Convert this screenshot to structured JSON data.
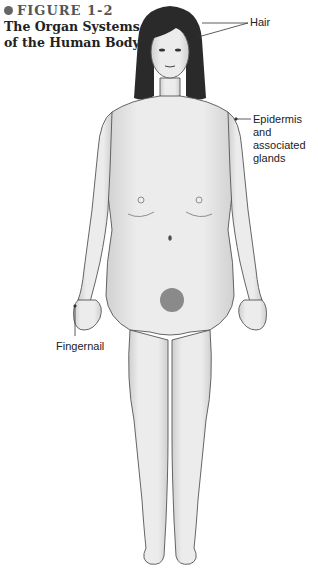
{
  "figure": {
    "number": "FIGURE 1-2",
    "caption_line1": "The Organ Systems",
    "caption_line2": "of the Human Body."
  },
  "labels": {
    "hair": "Hair",
    "epidermis_line1": "Epidermis and",
    "epidermis_line2": "associated",
    "epidermis_line3": "glands",
    "fingernail": "Fingernail"
  },
  "colors": {
    "skin": "#e6e6e6",
    "outline": "#555555",
    "hair": "#2a2a2a",
    "leader_line": "#333333"
  }
}
